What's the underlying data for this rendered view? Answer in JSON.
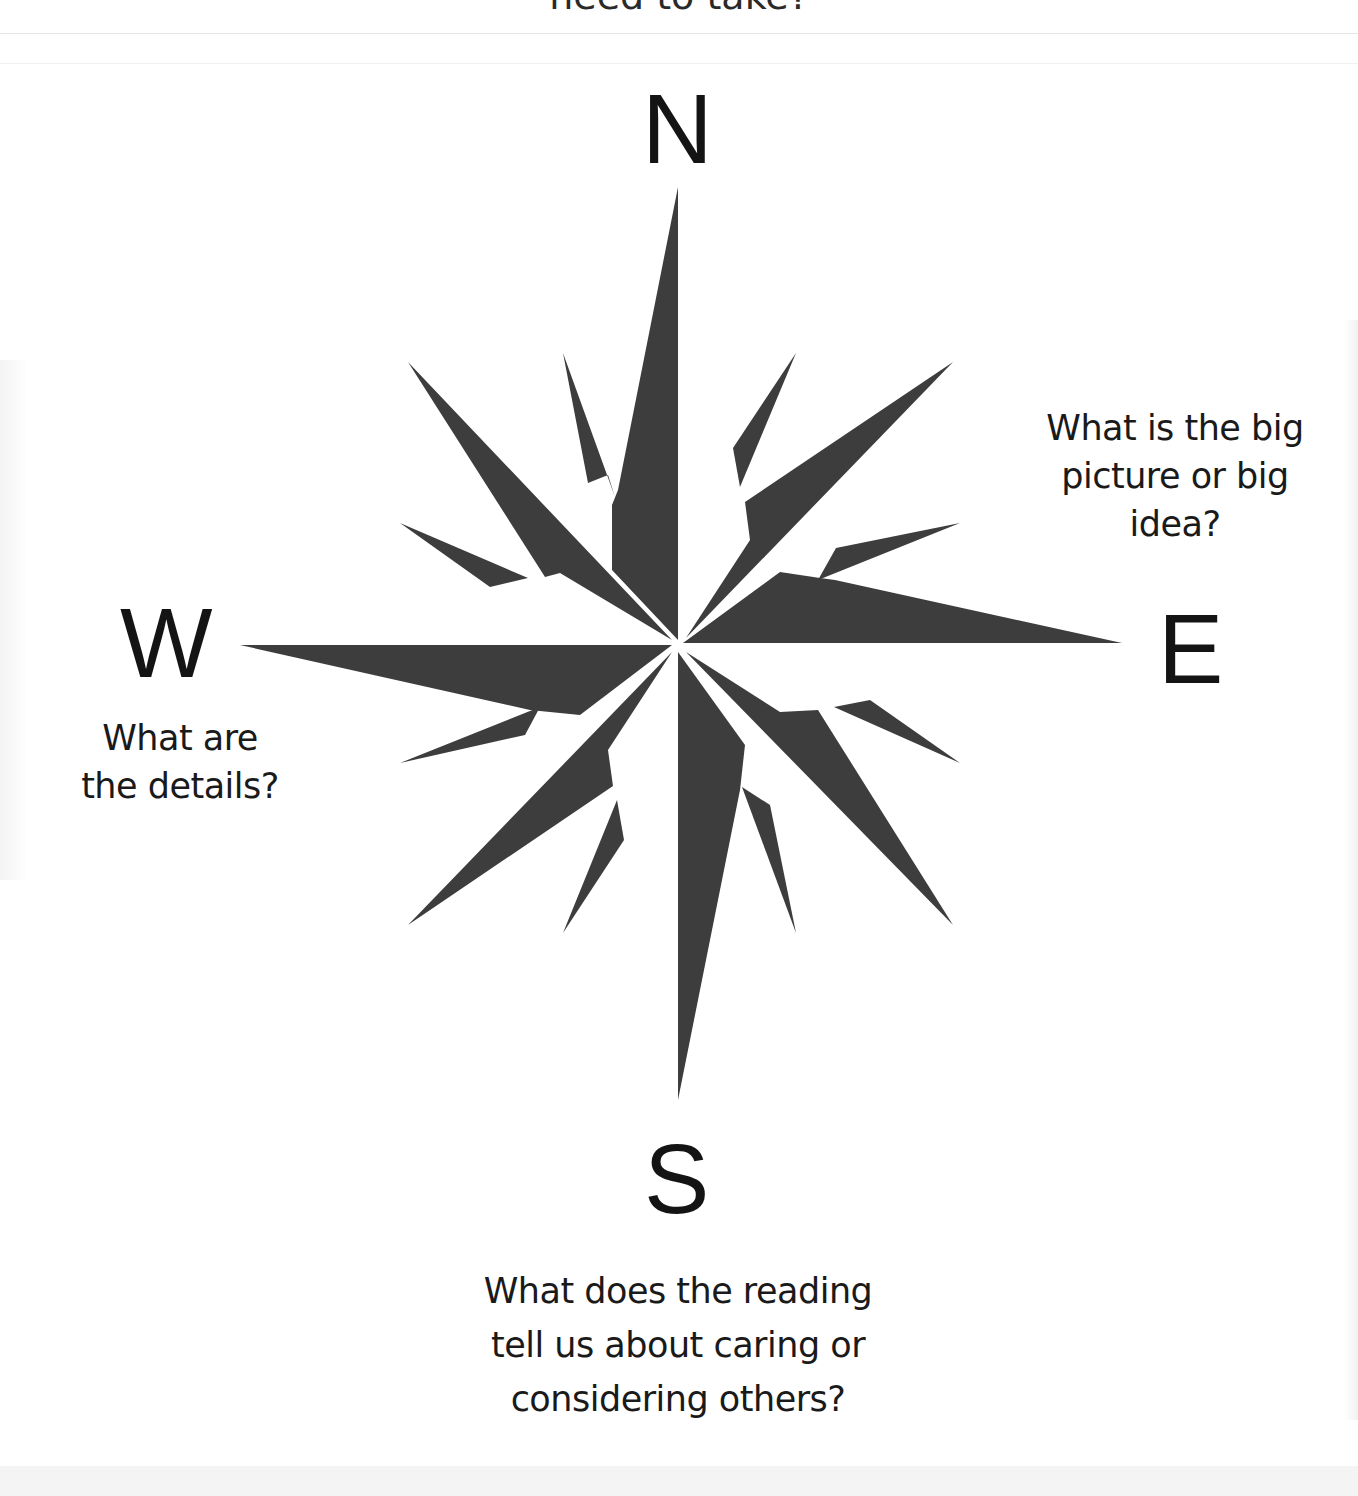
{
  "header": {
    "cut_off_text": "need to take?"
  },
  "compass": {
    "fill_color": "#3d3d3d",
    "directions": {
      "north": {
        "letter": "N"
      },
      "east": {
        "letter": "E",
        "prompt_lines": [
          "What is the big",
          "picture or big",
          "idea?"
        ]
      },
      "south": {
        "letter": "S",
        "prompt_lines": [
          "What does the reading",
          "tell us about caring or",
          "considering others?"
        ]
      },
      "west": {
        "letter": "W",
        "prompt_lines": [
          "What are",
          "the details?"
        ]
      }
    }
  }
}
